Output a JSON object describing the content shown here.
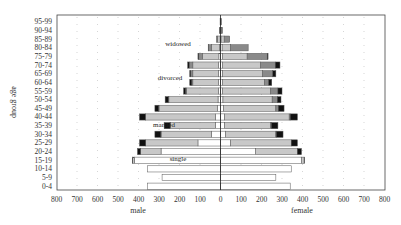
{
  "chart_data": {
    "type": "bar",
    "subtype": "population-pyramid",
    "title": "",
    "xlabel_left": "male",
    "xlabel_right": "female",
    "ylabel": "age group",
    "x_ticks": [
      800,
      700,
      600,
      500,
      400,
      300,
      200,
      100,
      0,
      100,
      200,
      300,
      400,
      500,
      600,
      700,
      800
    ],
    "xlim": [
      -800,
      800
    ],
    "grid": "dotted-vertical",
    "categories": [
      "95-99",
      "90-94",
      "85-89",
      "80-84",
      "75-79",
      "70-74",
      "65-69",
      "60-64",
      "55-59",
      "50-54",
      "45-49",
      "40-44",
      "35-39",
      "30-34",
      "25-29",
      "20-24",
      "15-19",
      "10-14",
      "5-9",
      "0-4"
    ],
    "segment_order": [
      "single",
      "married",
      "widowed",
      "divorced"
    ],
    "segment_colors": {
      "single": "#ffffff",
      "married": "#c8c8c8",
      "widowed": "#8a8a8a",
      "divorced": "#111111"
    },
    "annotations": [
      {
        "text": "widowed",
        "category": "80-84",
        "side": "male"
      },
      {
        "text": "divorced",
        "category": "60-64",
        "side": "male"
      },
      {
        "text": "married",
        "category": "35-39",
        "side": "male"
      },
      {
        "text": "single",
        "category": "15-19",
        "side": "male"
      }
    ],
    "male": {
      "single": [
        0,
        0,
        2,
        5,
        8,
        10,
        10,
        10,
        10,
        12,
        15,
        25,
        25,
        45,
        110,
        290,
        420,
        355,
        285,
        355
      ],
      "married": [
        1,
        3,
        12,
        40,
        80,
        125,
        125,
        125,
        155,
        240,
        285,
        340,
        220,
        245,
        255,
        100,
        8,
        0,
        0,
        0
      ],
      "widowed": [
        1,
        2,
        6,
        14,
        18,
        18,
        10,
        5,
        5,
        3,
        2,
        2,
        1,
        1,
        0,
        0,
        0,
        0,
        0,
        0
      ],
      "divorced": [
        0,
        0,
        0,
        1,
        4,
        7,
        5,
        10,
        10,
        15,
        18,
        28,
        29,
        29,
        30,
        15,
        2,
        0,
        0,
        0
      ]
    },
    "female": {
      "single": [
        0,
        1,
        3,
        8,
        10,
        10,
        10,
        10,
        10,
        12,
        15,
        20,
        20,
        25,
        50,
        170,
        395,
        345,
        270,
        340
      ],
      "married": [
        1,
        3,
        15,
        40,
        120,
        185,
        195,
        205,
        235,
        240,
        255,
        315,
        225,
        245,
        295,
        205,
        13,
        0,
        0,
        0
      ],
      "widowed": [
        4,
        6,
        27,
        87,
        98,
        72,
        50,
        20,
        35,
        25,
        12,
        5,
        3,
        2,
        0,
        0,
        0,
        0,
        0,
        0
      ],
      "divorced": [
        0,
        0,
        0,
        0,
        4,
        23,
        15,
        15,
        20,
        18,
        28,
        35,
        32,
        33,
        30,
        20,
        2,
        0,
        0,
        0
      ]
    }
  }
}
